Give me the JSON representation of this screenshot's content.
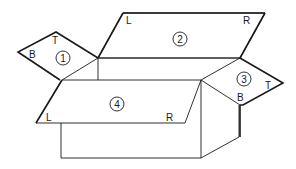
{
  "diagram": {
    "stroke_color": "#1a1a1a",
    "background": "#ffffff",
    "flaps": [
      {
        "id": "1",
        "number": "1",
        "labels": {
          "B": "B",
          "T": "T"
        }
      },
      {
        "id": "2",
        "number": "2",
        "labels": {
          "L": "L",
          "R": "R"
        }
      },
      {
        "id": "3",
        "number": "3",
        "labels": {
          "B": "B",
          "T": "T"
        }
      },
      {
        "id": "4",
        "number": "4",
        "labels": {
          "L": "L",
          "R": "R"
        }
      }
    ]
  }
}
